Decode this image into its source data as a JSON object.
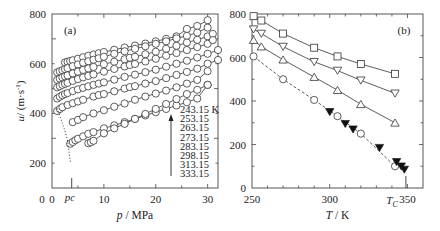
{
  "chart_data": [
    {
      "type": "line",
      "panel_label": "(a)",
      "title": "",
      "xlabel": "p / MPa",
      "ylabel": "u/ (m·s⁻¹)",
      "xlim": [
        0,
        32
      ],
      "ylim": [
        100,
        800
      ],
      "xticks": [
        0,
        10,
        20,
        30
      ],
      "yticks": [
        200,
        400,
        600,
        800
      ],
      "y_tick_labels": [
        "200",
        "400",
        "600",
        "800"
      ],
      "x_tick_labels": [
        "0",
        "10",
        "20",
        "30"
      ],
      "y_axis_zero_label": "0",
      "annotation_pc": {
        "label": "p",
        "subscript": "C",
        "x": 3.8
      },
      "grid": false,
      "marker": "open-circle",
      "legend": {
        "title_unit": "K",
        "entries": [
          "243.15 K",
          "253.15",
          "263.15",
          "273.15",
          "283.15",
          "298.15",
          "313.15",
          "333.15"
        ],
        "arrow": "up"
      },
      "series": [
        {
          "name": "243.15 K",
          "x": [
            2.5,
            3,
            3.5,
            4,
            5,
            6,
            7,
            8,
            9,
            10,
            12,
            14,
            16,
            18,
            20,
            22,
            24,
            26,
            28,
            30
          ],
          "y": [
            605,
            608,
            611,
            614,
            620,
            626,
            632,
            637,
            642,
            647,
            656,
            665,
            673,
            681,
            690,
            700,
            710,
            740,
            752,
            775
          ]
        },
        {
          "name": "253.15",
          "x": [
            1,
            1.5,
            2,
            2.5,
            3,
            4,
            5,
            6,
            7,
            8,
            9,
            10,
            12,
            14,
            16,
            18,
            20,
            22,
            24,
            26,
            28,
            30
          ],
          "y": [
            565,
            570,
            574,
            578,
            582,
            590,
            597,
            604,
            610,
            616,
            622,
            628,
            640,
            650,
            660,
            670,
            680,
            690,
            702,
            712,
            725,
            745
          ]
        },
        {
          "name": "263.15",
          "x": [
            1,
            1.5,
            2,
            2.5,
            3,
            4,
            5,
            6,
            7,
            8,
            10,
            12,
            14,
            15,
            16,
            18,
            20,
            22,
            24,
            26,
            28,
            30,
            31
          ],
          "y": [
            535,
            540,
            545,
            549,
            553,
            561,
            568,
            575,
            581,
            587,
            598,
            608,
            618,
            624,
            628,
            638,
            648,
            660,
            672,
            685,
            696,
            710,
            720
          ]
        },
        {
          "name": "273.15",
          "x": [
            1,
            1.5,
            2,
            2.5,
            3,
            4,
            5,
            6,
            7,
            8,
            10,
            12,
            14,
            15,
            16,
            18,
            20,
            22,
            24,
            26,
            28,
            30,
            31
          ],
          "y": [
            505,
            510,
            515,
            519,
            523,
            531,
            538,
            545,
            551,
            557,
            568,
            579,
            589,
            595,
            599,
            609,
            620,
            632,
            643,
            655,
            667,
            680,
            695
          ]
        },
        {
          "name": "283.15",
          "x": [
            1,
            1.5,
            2,
            2.5,
            3,
            4,
            5,
            6,
            7,
            8,
            9,
            10,
            12,
            14,
            16,
            18,
            20,
            22,
            24,
            26,
            28,
            30,
            32
          ],
          "y": [
            460,
            467,
            473,
            478,
            482,
            490,
            497,
            503,
            509,
            515,
            520,
            525,
            536,
            547,
            556,
            566,
            576,
            588,
            600,
            612,
            625,
            640,
            655
          ]
        },
        {
          "name": "298.15",
          "x": [
            1,
            1.5,
            2,
            3,
            4,
            5,
            6,
            8,
            9,
            10,
            12,
            14,
            15,
            16,
            18,
            20,
            22,
            24,
            26,
            28,
            30,
            32
          ],
          "y": [
            410,
            418,
            425,
            434,
            441,
            448,
            455,
            468,
            474,
            478,
            489,
            500,
            506,
            510,
            520,
            530,
            542,
            555,
            567,
            580,
            600,
            615
          ]
        },
        {
          "name": "313.15",
          "x": [
            4,
            5,
            6,
            8,
            10,
            12,
            14,
            16,
            18,
            20,
            22,
            24,
            26,
            28,
            30
          ],
          "y": [
            365,
            374,
            385,
            400,
            413,
            427,
            440,
            455,
            468,
            480,
            492,
            505,
            520,
            535,
            570
          ]
        },
        {
          "name": "333.15",
          "x": [
            3.5,
            4,
            4.5,
            5,
            6,
            7,
            8,
            10,
            12,
            14,
            16,
            18,
            20,
            22,
            24,
            26,
            28,
            30
          ],
          "y": [
            278,
            285,
            292,
            298,
            308,
            318,
            325,
            340,
            352,
            365,
            378,
            392,
            405,
            418,
            432,
            445,
            460,
            515
          ]
        },
        {
          "name": "saturation (dotted)",
          "style": "dotted",
          "x": [
            1,
            1.5,
            2,
            2.5,
            3,
            3.3,
            3.6
          ],
          "y": [
            420,
            390,
            360,
            330,
            290,
            240,
            200
          ]
        },
        {
          "name": "333.15 low-p",
          "x": [
            7,
            7.5,
            8,
            10,
            12,
            14,
            16,
            18,
            20,
            22,
            24,
            26,
            28,
            30
          ],
          "y": [
            280,
            284,
            290,
            320,
            340,
            358,
            378,
            398,
            418,
            438,
            458,
            478,
            495,
            515
          ]
        }
      ]
    },
    {
      "type": "line",
      "panel_label": "(b)",
      "title": "",
      "xlabel": "T / K",
      "ylabel": "",
      "xlim": [
        250,
        360
      ],
      "ylim": [
        0,
        800
      ],
      "xticks": [
        250,
        300,
        350
      ],
      "x_tick_labels": [
        "250",
        "300",
        "350"
      ],
      "yticks": [
        0,
        200,
        400,
        600,
        800
      ],
      "y_tick_labels": [
        "0",
        "200",
        "400",
        "600",
        "800"
      ],
      "annotation_tc": {
        "label": "T",
        "subscript": "C",
        "x": 349
      },
      "grid": false,
      "series": [
        {
          "name": "squares",
          "marker": "open-square",
          "style": "solid",
          "x": [
            251,
            256,
            270,
            290,
            305,
            320,
            342
          ],
          "y": [
            790,
            770,
            710,
            645,
            605,
            570,
            525
          ]
        },
        {
          "name": "down-triangles",
          "marker": "open-down-triangle",
          "style": "solid",
          "x": [
            251,
            256,
            270,
            290,
            305,
            320,
            342
          ],
          "y": [
            730,
            710,
            650,
            580,
            540,
            495,
            435
          ]
        },
        {
          "name": "up-triangles",
          "marker": "open-up-triangle",
          "style": "solid",
          "x": [
            251,
            256,
            270,
            290,
            305,
            320,
            342
          ],
          "y": [
            680,
            650,
            590,
            510,
            450,
            385,
            300
          ]
        },
        {
          "name": "circles",
          "marker": "open-circle",
          "style": "dashed",
          "x": [
            251,
            270,
            290,
            305,
            320,
            342
          ],
          "y": [
            605,
            500,
            405,
            330,
            250,
            100
          ]
        },
        {
          "name": "filled-down-triangles",
          "marker": "filled-down-triangle",
          "style": "none",
          "x": [
            300,
            310,
            315,
            332,
            343,
            346,
            348
          ],
          "y": [
            350,
            295,
            270,
            185,
            120,
            100,
            85
          ]
        }
      ]
    }
  ]
}
